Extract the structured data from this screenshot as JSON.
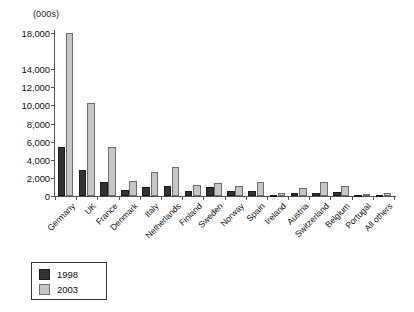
{
  "chart_data": {
    "type": "bar",
    "title": "",
    "units_caption": "(000s)",
    "xlabel": "",
    "ylabel": "",
    "ylim": [
      0,
      18000
    ],
    "ytick_labels": [
      "18,000",
      "14,000",
      "12,000",
      "10,000",
      "8,000",
      "6,000",
      "4,000",
      "2,000",
      "0"
    ],
    "ytick_values": [
      18000,
      14000,
      12000,
      10000,
      8000,
      6000,
      4000,
      2000,
      0
    ],
    "grid": false,
    "legend_position": "bottom-left",
    "categories": [
      "Germany",
      "UK",
      "France",
      "Denmark",
      "Italy",
      "Netherlands",
      "Finland",
      "Sweden",
      "Norway",
      "Spain",
      "Ireland",
      "Austria",
      "Switzerland",
      "Belgium",
      "Portugal",
      "All others"
    ],
    "series": [
      {
        "name": "1998",
        "color": "#333333",
        "values": [
          5400,
          2900,
          1600,
          700,
          950,
          1050,
          600,
          950,
          500,
          500,
          150,
          300,
          350,
          450,
          150,
          150
        ]
      },
      {
        "name": "2003",
        "color": "#c6c6c6",
        "values": [
          18000,
          10300,
          5400,
          1700,
          2600,
          3200,
          1200,
          1400,
          1150,
          1500,
          300,
          900,
          1550,
          1050,
          200,
          350
        ]
      }
    ]
  },
  "legend": {
    "items": [
      {
        "label": "1998",
        "swatch": "dark"
      },
      {
        "label": "2003",
        "swatch": "light"
      }
    ]
  }
}
